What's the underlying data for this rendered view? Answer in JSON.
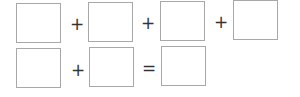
{
  "equation": {
    "row1": {
      "operators": [
        "+",
        "+",
        "+"
      ],
      "boxes": [
        "",
        "",
        "",
        ""
      ]
    },
    "row2": {
      "operators": [
        "+",
        "="
      ],
      "boxes": [
        "",
        "",
        ""
      ]
    }
  },
  "colors": {
    "box_border": "#a8a8a8",
    "operator": "#333333",
    "background": "#ffffff"
  }
}
